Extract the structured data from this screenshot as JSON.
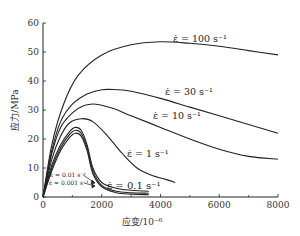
{
  "chart_data": {
    "type": "line",
    "title": "",
    "xlabel": "应变/10⁻⁶",
    "ylabel": "应力/MPa",
    "xlim": [
      0,
      8000
    ],
    "ylim": [
      0,
      60
    ],
    "xticks": [
      0,
      2000,
      4000,
      6000,
      8000
    ],
    "xticks_minor": [
      1000,
      3000,
      5000,
      7000
    ],
    "yticks": [
      0,
      10,
      20,
      30,
      40,
      50,
      60
    ],
    "grid": false,
    "legend": "inline annotations",
    "series": [
      {
        "name": "ε̇ = 100 s⁻¹",
        "label": "ε̇ = 100 s⁻¹",
        "x": [
          0,
          300,
          700,
          1200,
          2000,
          3000,
          4000,
          5000,
          6000,
          7000,
          8000
        ],
        "y": [
          0,
          18,
          32,
          42,
          49,
          52.5,
          53.5,
          53,
          52,
          50.5,
          49
        ]
      },
      {
        "name": "ε̇ = 30 s⁻¹",
        "label": "ε̇ = 30 s⁻¹",
        "x": [
          0,
          300,
          600,
          1000,
          1500,
          2000,
          2500,
          3000,
          4000,
          5000,
          6000,
          7000,
          8000
        ],
        "y": [
          0,
          16,
          26,
          32,
          35.5,
          37,
          37,
          36.5,
          34,
          31,
          28,
          25,
          22
        ]
      },
      {
        "name": "ε̇ = 10 s⁻¹",
        "label": "ε̇ = 10 s⁻¹",
        "x": [
          0,
          300,
          600,
          1000,
          1400,
          1800,
          2400,
          3000,
          4000,
          5000,
          6000,
          7000,
          8000
        ],
        "y": [
          0,
          15,
          24,
          29,
          31.5,
          32,
          30.5,
          28,
          24,
          20,
          16.5,
          14,
          13
        ]
      },
      {
        "name": "ε̇ = 1 s⁻¹",
        "label": "ε̇ = 1 s⁻¹",
        "x": [
          0,
          300,
          600,
          900,
          1300,
          1700,
          2200,
          2700,
          3200,
          3700,
          4200,
          4500
        ],
        "y": [
          0,
          13,
          21,
          25.5,
          27,
          26,
          21,
          15,
          10,
          7.5,
          6,
          5
        ]
      },
      {
        "name": "ε̇ = 0.1 s⁻¹",
        "label": "ε̇ = 0.1 s⁻¹",
        "x": [
          0,
          300,
          600,
          900,
          1100,
          1300,
          1500,
          1700,
          2000,
          2500,
          3000,
          3600
        ],
        "y": [
          0,
          11,
          18,
          22.5,
          24,
          23,
          18,
          10,
          5,
          3,
          2.3,
          2
        ]
      },
      {
        "name": "ε̇ = 0.01 s⁻¹",
        "label": "ε̇ = 0.01 s⁻¹",
        "x": [
          0,
          300,
          600,
          900,
          1100,
          1300,
          1500,
          1700,
          2000,
          2500,
          3000,
          3600
        ],
        "y": [
          0,
          10,
          17,
          21.5,
          23,
          22,
          17,
          9,
          4,
          2,
          1.5,
          1.3
        ]
      },
      {
        "name": "ε̇ = 0.001 s⁻¹",
        "label": "ε̇ = 0.001 s⁻¹",
        "x": [
          0,
          300,
          600,
          900,
          1100,
          1300,
          1500,
          1700,
          2000,
          2500,
          3000,
          3600
        ],
        "y": [
          0,
          9,
          16,
          20.5,
          22,
          21,
          16,
          8,
          3.5,
          1.5,
          1,
          0.8
        ]
      }
    ],
    "annotations": [
      {
        "text": "ε̇ = 100 s⁻¹",
        "x": 4400,
        "y": 55
      },
      {
        "text": "ε̇ = 30 s⁻¹",
        "x": 4200,
        "y": 37
      },
      {
        "text": "ε̇ = 10 s⁻¹",
        "x": 3800,
        "y": 32
      },
      {
        "text": "ε̇ = 1 s⁻¹",
        "x": 3300,
        "y": 14
      },
      {
        "text": "ε̇ = 0.1 s⁻¹",
        "x": 2400,
        "y": 4
      },
      {
        "text": "ε̇ = 0.01 s⁻¹",
        "x": 100,
        "y": 6
      },
      {
        "text": "ε̇ = 0.001 s⁻¹",
        "x": 100,
        "y": 3
      }
    ]
  },
  "labels": {
    "xlabel": "应变/10⁻⁶",
    "ylabel": "应力/MPa",
    "ann_100": "ε̇ = 100 s⁻¹",
    "ann_30": "ε̇ = 30 s⁻¹",
    "ann_10": "ε̇ = 10 s⁻¹",
    "ann_1": "ε̇ = 1 s⁻¹",
    "ann_01": "ε̇ = 0.1 s⁻¹",
    "ann_001": "ε̇ = 0.01 s⁻¹",
    "ann_0001": "ε̇ = 0.001 s⁻¹"
  }
}
